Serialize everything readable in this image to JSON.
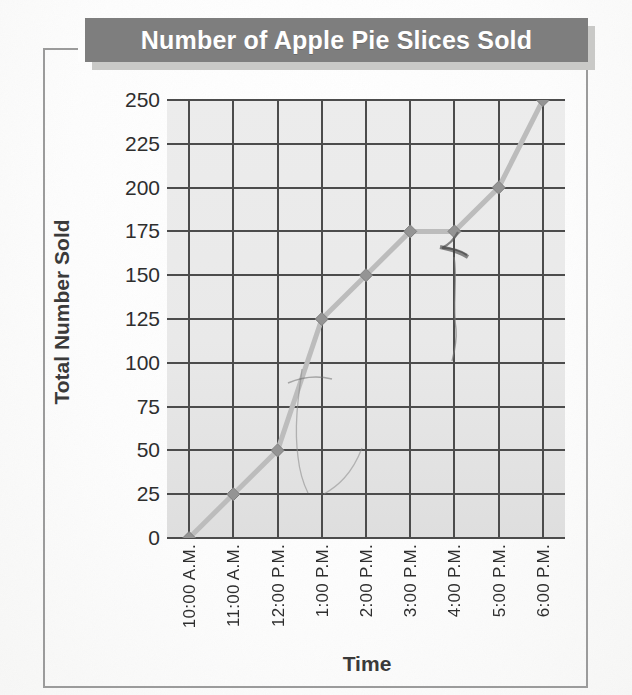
{
  "title": "Number of Apple Pie Slices Sold",
  "axis": {
    "x_title": "Time",
    "y_title": "Total Number Sold"
  },
  "chart_data": {
    "type": "line",
    "title": "Number of Apple Pie Slices Sold",
    "xlabel": "Time",
    "ylabel": "Total Number Sold",
    "categories": [
      "10:00 A.M.",
      "11:00 A.M.",
      "12:00 P.M.",
      "1:00 P.M.",
      "2:00 P.M.",
      "3:00 P.M.",
      "4:00 P.M.",
      "5:00 P.M.",
      "6:00 P.M."
    ],
    "values": [
      0,
      25,
      50,
      125,
      150,
      175,
      175,
      200,
      250
    ],
    "ylim": [
      0,
      250
    ],
    "ytick_labels": [
      "0",
      "25",
      "50",
      "75",
      "100",
      "125",
      "150",
      "175",
      "200",
      "225",
      "250"
    ],
    "ytick_values": [
      0,
      25,
      50,
      75,
      100,
      125,
      150,
      175,
      200,
      225,
      250
    ],
    "ytick_step": 25,
    "grid": true,
    "legend": "none",
    "marker": "diamond",
    "series_color": "#b9b9b9",
    "marker_color": "#949494"
  },
  "colors": {
    "title_bar": "#7e7e7e",
    "title_text": "#ffffff",
    "grid_line": "#4c4c4c",
    "plot_background": "#e9e9e9",
    "frame": "#9b9b9b",
    "text": "#2e2e2e"
  }
}
